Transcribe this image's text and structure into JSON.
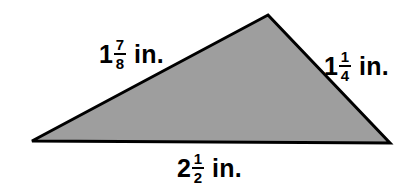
{
  "figure": {
    "name": "triangle-with-side-measurements",
    "shape": "triangle",
    "background_color": "#ffffff",
    "fill_color": "#9e9e9e",
    "stroke_color": "#000000",
    "stroke_width": 3,
    "vertices": [
      {
        "name": "apex",
        "x": 268,
        "y": 15
      },
      {
        "name": "bottom-right",
        "x": 390,
        "y": 143
      },
      {
        "name": "bottom-left",
        "x": 32,
        "y": 141
      }
    ],
    "points_attr": "268,15 390,143 32,141"
  },
  "labels": {
    "left_side": {
      "whole": "1",
      "numerator": "7",
      "denominator": "8",
      "unit": "in.",
      "full_text": "1 7/8 in."
    },
    "right_side": {
      "whole": "1",
      "numerator": "1",
      "denominator": "4",
      "unit": "in.",
      "full_text": "1 1/4 in."
    },
    "base": {
      "whole": "2",
      "numerator": "1",
      "denominator": "2",
      "unit": "in.",
      "full_text": "2 1/2 in."
    }
  }
}
